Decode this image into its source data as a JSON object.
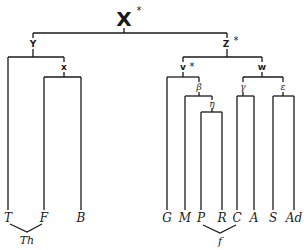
{
  "diagram": {
    "type": "stemma codicum",
    "root": {
      "label": "X",
      "mark": "*"
    },
    "nodes": {
      "Y": {
        "label": "Y"
      },
      "x": {
        "label": "x"
      },
      "Z": {
        "label": "Z",
        "mark": "*"
      },
      "v": {
        "label": "v",
        "mark": "*"
      },
      "w": {
        "label": "w"
      },
      "beta": {
        "label": "β"
      },
      "eta": {
        "label": "η"
      },
      "gamma": {
        "label": "γ"
      },
      "epsilon": {
        "label": "ε"
      }
    },
    "leaves": [
      {
        "id": "T",
        "label": "T"
      },
      {
        "id": "F",
        "label": "F"
      },
      {
        "id": "B",
        "label": "B"
      },
      {
        "id": "G",
        "label": "G"
      },
      {
        "id": "M",
        "label": "M"
      },
      {
        "id": "P",
        "label": "P"
      },
      {
        "id": "R",
        "label": "R"
      },
      {
        "id": "C",
        "label": "C"
      },
      {
        "id": "A",
        "label": "A"
      },
      {
        "id": "S",
        "label": "S"
      },
      {
        "id": "Ad",
        "label": "Ad"
      }
    ],
    "contaminations": [
      {
        "label": "Th",
        "from": [
          "T",
          "F"
        ]
      },
      {
        "label": "f",
        "from": [
          "P",
          "C"
        ]
      }
    ],
    "edges": [
      [
        "X",
        "Y"
      ],
      [
        "X",
        "Z"
      ],
      [
        "Y",
        "T"
      ],
      [
        "Y",
        "x"
      ],
      [
        "x",
        "F"
      ],
      [
        "x",
        "B"
      ],
      [
        "Z",
        "v"
      ],
      [
        "Z",
        "w"
      ],
      [
        "v",
        "G"
      ],
      [
        "v",
        "beta"
      ],
      [
        "beta",
        "M"
      ],
      [
        "beta",
        "eta"
      ],
      [
        "eta",
        "P"
      ],
      [
        "eta",
        "R"
      ],
      [
        "w",
        "gamma"
      ],
      [
        "w",
        "epsilon"
      ],
      [
        "gamma",
        "C"
      ],
      [
        "gamma",
        "A"
      ],
      [
        "epsilon",
        "S"
      ],
      [
        "epsilon",
        "Ad"
      ]
    ]
  }
}
